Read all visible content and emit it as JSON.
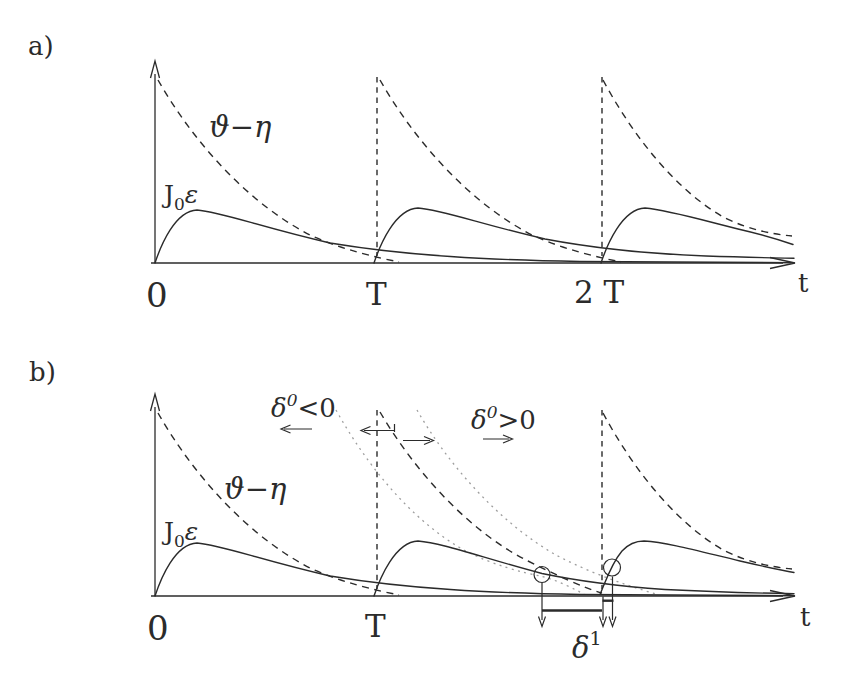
{
  "figure": {
    "colors": {
      "background": "#ffffff",
      "ink": "#2b2b2b",
      "dotted_curve": "#9e9e9e"
    }
  },
  "panel_a": {
    "label": "a)",
    "dashed_curve_label": "ϑ−η",
    "solid_curve_label": {
      "base": "J",
      "sub": "0",
      "suffix": "ε"
    },
    "x_ticks": [
      "0",
      "T",
      "2 T"
    ],
    "x_axis_label": "t"
  },
  "panel_b": {
    "label": "b)",
    "dashed_curve_label": "ϑ−η",
    "solid_curve_label": {
      "base": "J",
      "sub": "0",
      "suffix": "ε"
    },
    "x_ticks": [
      "0",
      "T"
    ],
    "x_axis_label": "t",
    "annotations": {
      "shift_left": {
        "base": "δ",
        "sup": "0",
        "rel": "<0"
      },
      "shift_right": {
        "base": "δ",
        "sup": "0",
        "rel": ">0"
      },
      "next_shift": {
        "base": "δ",
        "sup": "1"
      }
    }
  }
}
